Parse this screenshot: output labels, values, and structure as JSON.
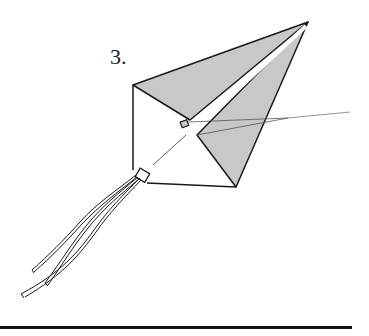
{
  "figure": {
    "step_label": "3.",
    "colors": {
      "stroke": "#1a1a1a",
      "shaded_panel": "#c8c8c8",
      "background": "#ffffff",
      "rule": "#111111"
    }
  }
}
